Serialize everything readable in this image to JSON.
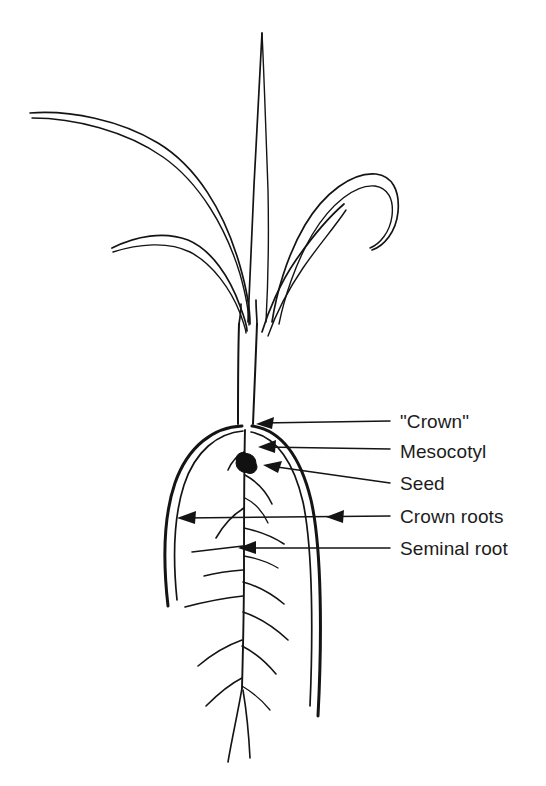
{
  "figure": {
    "type": "botanical-line-diagram",
    "background_color": "#ffffff",
    "line_color": "#141414",
    "text_color": "#1c1c1c"
  },
  "labels": [
    {
      "id": "crown",
      "text": "\"Crown\"",
      "text_x": 400,
      "text_y": 428,
      "leader_start_x": 390,
      "leader_start_y": 421,
      "leader_end_x": 258,
      "leader_end_y": 424,
      "arrow_angle": 186
    },
    {
      "id": "mesocotyl",
      "text": "Mesocotyl",
      "text_x": 400,
      "text_y": 458,
      "leader_start_x": 390,
      "leader_start_y": 449,
      "leader_end_x": 259,
      "leader_end_y": 447,
      "arrow_angle": 181
    },
    {
      "id": "seed",
      "text": "Seed",
      "text_x": 400,
      "text_y": 490,
      "leader_start_x": 390,
      "leader_start_y": 483,
      "leader_end_x": 264,
      "leader_end_y": 466,
      "arrow_angle": 172
    },
    {
      "id": "crown-roots",
      "text": "Crown roots",
      "text_x": 400,
      "text_y": 523,
      "leader_start_x": 390,
      "leader_start_y": 516,
      "leader_end_x": 178,
      "leader_end_y": 518,
      "arrow_angle": 180,
      "second_arrow_x": 330,
      "second_arrow_y": 517
    },
    {
      "id": "seminal-root",
      "text": "Seminal root",
      "text_x": 400,
      "text_y": 555,
      "leader_start_x": 390,
      "leader_start_y": 548,
      "leader_end_x": 238,
      "leader_end_y": 548,
      "arrow_angle": 180
    }
  ],
  "anatomy": {
    "seed": {
      "cx": 246,
      "cy": 463,
      "r": 9.5
    },
    "crown": {
      "x": 245,
      "y": 424
    },
    "stem": {
      "top_y": 325,
      "bottom_y": 425,
      "left_x": 238,
      "right_x": 252
    },
    "leaf_count": 5,
    "central_leaf_tip": {
      "x": 262,
      "y": 33
    },
    "upper_left_leaf_tip": {
      "x": 30,
      "y": 113
    },
    "lower_left_leaf_tip": {
      "x": 112,
      "y": 248
    },
    "right_leaf_tip": {
      "x": 362,
      "y": 248
    },
    "lower_right_leaf_tip": {
      "x": 330,
      "y": 196
    },
    "left_crown_root_end": {
      "x": 168,
      "y": 606
    },
    "right_crown_root_end": {
      "x": 318,
      "y": 716
    },
    "seminal_root_end": {
      "x": 228,
      "y": 762
    }
  }
}
